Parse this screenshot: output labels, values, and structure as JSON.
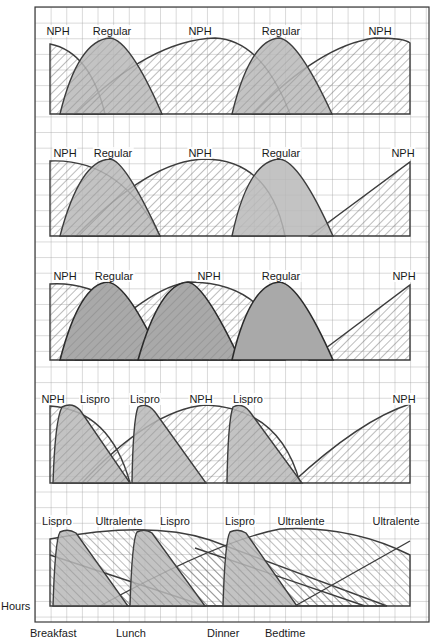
{
  "figure": {
    "axis_label": "Hours",
    "meal_markers": [
      {
        "label": "Breakfast",
        "x": 53
      },
      {
        "label": "Lunch",
        "x": 130
      },
      {
        "label": "Dinner",
        "x": 224
      },
      {
        "label": "Bedtime",
        "x": 285
      }
    ],
    "colors": {
      "grid": "#9a9a9a",
      "frame": "#3a3a3a",
      "curve": "#3c3c3c",
      "rapid_fill": "#b8b8b8",
      "hatch": "#6a6a6a"
    },
    "panels": [
      {
        "id": 1,
        "labels": [
          {
            "text": "NPH",
            "x": 58
          },
          {
            "text": "Regular",
            "x": 112
          },
          {
            "text": "NPH",
            "x": 200
          },
          {
            "text": "Regular",
            "x": 281
          },
          {
            "text": "NPH",
            "x": 380
          }
        ]
      },
      {
        "id": 2,
        "labels": [
          {
            "text": "NPH",
            "x": 65
          },
          {
            "text": "Regular",
            "x": 113
          },
          {
            "text": "NPH",
            "x": 200
          },
          {
            "text": "Regular",
            "x": 281
          },
          {
            "text": "NPH",
            "x": 403
          }
        ]
      },
      {
        "id": 3,
        "labels": [
          {
            "text": "NPH",
            "x": 65
          },
          {
            "text": "Regular",
            "x": 114
          },
          {
            "text": "NPH",
            "x": 209
          },
          {
            "text": "Regular",
            "x": 281
          },
          {
            "text": "NPH",
            "x": 404
          }
        ]
      },
      {
        "id": 4,
        "labels": [
          {
            "text": "NPH",
            "x": 53
          },
          {
            "text": "Lispro",
            "x": 95
          },
          {
            "text": "Lispro",
            "x": 145
          },
          {
            "text": "NPH",
            "x": 201
          },
          {
            "text": "Lispro",
            "x": 248
          },
          {
            "text": "NPH",
            "x": 404
          }
        ]
      },
      {
        "id": 5,
        "labels": [
          {
            "text": "Lispro",
            "x": 57
          },
          {
            "text": "Ultralente",
            "x": 119
          },
          {
            "text": "Lispro",
            "x": 175
          },
          {
            "text": "Lispro",
            "x": 240
          },
          {
            "text": "Ultralente",
            "x": 301
          },
          {
            "text": "Ultralente",
            "x": 396
          }
        ]
      }
    ]
  }
}
